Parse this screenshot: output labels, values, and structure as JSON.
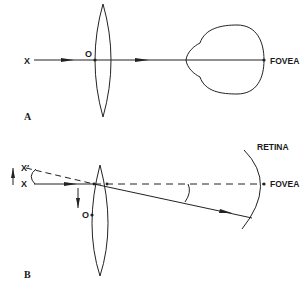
{
  "panel_a": {
    "label": "A",
    "object_label": "X",
    "nodal_point_label": "O",
    "fovea_label": "FOVEA"
  },
  "panel_b": {
    "label": "B",
    "object_label": "X",
    "displaced_object_label": "X′",
    "nodal_point_label": "O",
    "fovea_label": "FOVEA",
    "retina_label": "RETINA"
  },
  "colors": {
    "line": "#222222",
    "background": "#ffffff"
  }
}
